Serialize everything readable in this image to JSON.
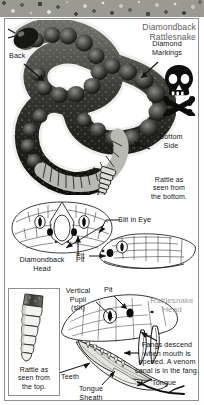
{
  "plate": {
    "title": "Diamondback\nRattlesnake",
    "alt": "Diamondback rattlesnake anatomy plate"
  },
  "top_figure": {
    "name": "diamondback-rattlesnake-body-photo",
    "labels": {
      "back": "Back",
      "diamond_markings": "Diamond\nMarkings",
      "bottom_side": "Bottom\nSide",
      "rattle_bottom_caption": "Rattle as\nseen from\nthe bottom."
    },
    "icons": {
      "venom_warning": "skull-and-crossbones-icon"
    }
  },
  "head_figures": {
    "diamondback_head_label": "Diamondback\nHead",
    "slit_in_eye": "Slit in Eye",
    "pit_upper": "Pit",
    "pit_side": "Pit"
  },
  "mouth_figure": {
    "name": "open-mouth-rattlesnake-head",
    "head_label": "Rattlesnake\nHead",
    "vertical_pupil": "Vertical\nPupil\n(slit)",
    "pit": "Pit",
    "fangs_note": "Fangs descend\nwhen mouth is\nopened. A venom\ncanal is in the fang.",
    "teeth": "Teeth",
    "tongue_sheath": "Tongue\nSheath",
    "tongue": "Tongue"
  },
  "rattle_inset": {
    "name": "rattle-top-view-inset",
    "caption": "Rattle as\nseen from\nthe top."
  },
  "colors": {
    "frame": "#8e8e8e",
    "text": "#141414",
    "title_gray": "#5d5d5d",
    "label_gray": "#9d9d9d",
    "ink": "#1b1b1b",
    "paper": "#ffffff"
  }
}
